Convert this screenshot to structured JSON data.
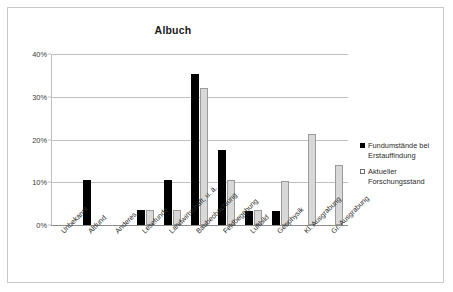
{
  "chart_data": {
    "type": "bar",
    "title": "Albuch",
    "xlabel": "",
    "ylabel": "",
    "ylim": [
      0,
      40
    ],
    "ytick_labels": [
      "0%",
      "10%",
      "20%",
      "30%",
      "40%"
    ],
    "ytick_values": [
      0,
      10,
      20,
      30,
      40
    ],
    "grid": true,
    "legend_position": "right",
    "categories": [
      "Unbekannt",
      "Altfund",
      "Anderes",
      "Lesefunde",
      "Landwirtschaft, u. ä.",
      "Baubeobachtung",
      "Feldbegehung",
      "Luftbild",
      "Geophysik",
      "Kl. Ausgrabung",
      "Gr. Ausgrabung"
    ],
    "series": [
      {
        "name": "Fundumstände bei Erstauffindung",
        "color": "#000000",
        "values": [
          0,
          10.5,
          0,
          3.4,
          10.5,
          35.3,
          17.5,
          3.3,
          3.3,
          0,
          0
        ]
      },
      {
        "name": "Aktueller Forschungsstand",
        "color": "#d8d8d8",
        "values": [
          0,
          0,
          0,
          3.4,
          3.4,
          32.0,
          10.5,
          3.4,
          10.4,
          21.2,
          14.0
        ]
      }
    ]
  },
  "legend": {
    "items": [
      {
        "label_line1": "Fundumstände bei",
        "label_line2": "Erstauffindung",
        "swatch": "filled-square-icon"
      },
      {
        "label_line1": "Aktueller",
        "label_line2": "Forschungsstand",
        "swatch": "hollow-square-icon"
      }
    ]
  }
}
